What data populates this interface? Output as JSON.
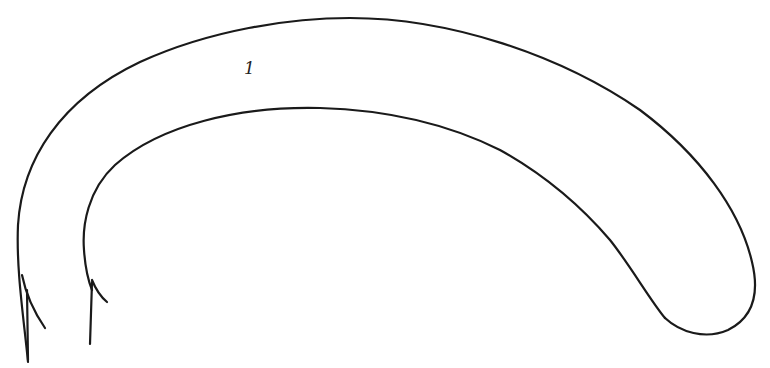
{
  "figure": {
    "stroke_color": "#1a1a1a",
    "background_color": "#ffffff",
    "labels": [
      {
        "text": "1",
        "x": 244,
        "y": 60
      }
    ]
  }
}
